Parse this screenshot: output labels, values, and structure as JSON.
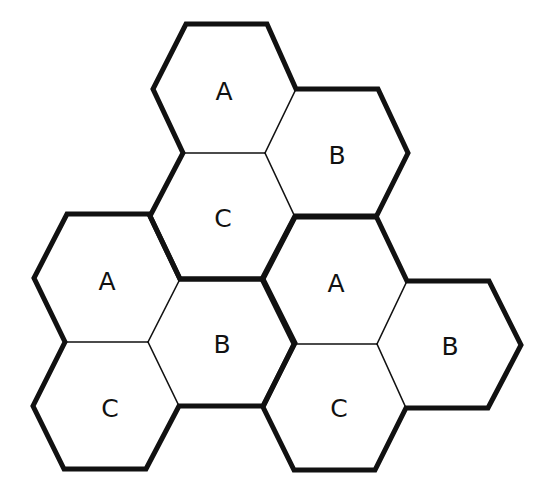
{
  "diagram": {
    "colors": {
      "stroke": "#111111",
      "fill": "#ffffff",
      "background": "#ffffff"
    },
    "stroke_widths": {
      "thick": 5,
      "thin": 1.6
    },
    "hexagons": [
      {
        "id": "top-a",
        "label": "A",
        "cx": 224,
        "cy": 89,
        "cluster": "top"
      },
      {
        "id": "top-b",
        "label": "B",
        "cx": 337,
        "cy": 153,
        "cluster": "top"
      },
      {
        "id": "top-c",
        "label": "C",
        "cx": 223,
        "cy": 216,
        "cluster": "top"
      },
      {
        "id": "left-a",
        "label": "A",
        "cx": 107,
        "cy": 278,
        "cluster": "left"
      },
      {
        "id": "left-b",
        "label": "B",
        "cx": 222,
        "cy": 342,
        "cluster": "left"
      },
      {
        "id": "left-c",
        "label": "C",
        "cx": 106,
        "cy": 406,
        "cluster": "left"
      },
      {
        "id": "right-a",
        "label": "A",
        "cx": 335,
        "cy": 280,
        "cluster": "right"
      },
      {
        "id": "right-b",
        "label": "B",
        "cx": 449,
        "cy": 344,
        "cluster": "right"
      },
      {
        "id": "right-c",
        "label": "C",
        "cx": 335,
        "cy": 407,
        "cluster": "right"
      }
    ]
  }
}
